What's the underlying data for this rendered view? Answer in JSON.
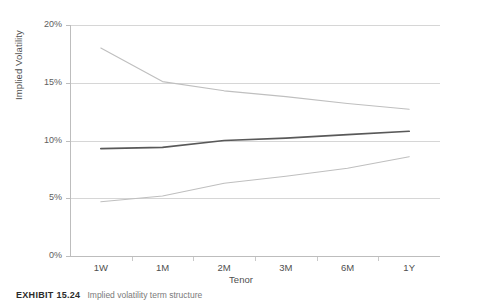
{
  "chart_data": {
    "type": "line",
    "title": "",
    "xlabel": "Tenor",
    "ylabel": "Implied Volatility",
    "categories": [
      "1W",
      "1M",
      "2M",
      "3M",
      "6M",
      "1Y"
    ],
    "ylim": [
      0,
      20
    ],
    "y_ticks": [
      "0%",
      "5%",
      "10%",
      "15%",
      "20%"
    ],
    "y_tick_values": [
      0,
      5,
      10,
      15,
      20
    ],
    "grid": true,
    "legend": "none",
    "series": [
      {
        "name": "upper",
        "values": [
          18.0,
          15.1,
          14.3,
          13.8,
          13.2,
          12.7
        ],
        "color": "#bfbfbf",
        "width": 1.1
      },
      {
        "name": "middle",
        "values": [
          9.3,
          9.4,
          10.0,
          10.2,
          10.5,
          10.8
        ],
        "color": "#595959",
        "width": 1.7
      },
      {
        "name": "lower",
        "values": [
          4.7,
          5.2,
          6.3,
          6.9,
          7.6,
          8.6
        ],
        "color": "#bfbfbf",
        "width": 1.1
      }
    ]
  },
  "caption": {
    "label": "EXHIBIT 15.24",
    "text": "Implied volatility term structure"
  },
  "colors": {
    "gridline": "#d6d6d6",
    "axis": "#bdbdbd",
    "text": "#5a5a5a"
  }
}
